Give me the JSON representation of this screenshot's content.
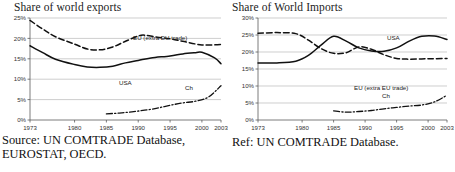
{
  "figure": {
    "panels": [
      {
        "id": "exports",
        "title": "Share of world exports",
        "caption": "Source: UN COMTRADE Database, EUROSTAT, OECD.",
        "labels": {
          "eu": "EU (extra EU trade)",
          "usa": "USA",
          "ch": "Ch"
        }
      },
      {
        "id": "imports",
        "title": "Share of World Imports",
        "caption": "Ref: UN COMTRADE Database.",
        "labels": {
          "eu": "EU (extra EU trade)",
          "usa": "USA",
          "ch": "Ch"
        }
      }
    ]
  },
  "chart_data": [
    {
      "type": "line",
      "title": "Share of world exports",
      "xlabel": "",
      "ylabel": "",
      "xlim": [
        1973,
        2003
      ],
      "ylim": [
        0,
        25
      ],
      "grid": true,
      "legend_position": "inline-annotations",
      "xticks": [
        1973,
        1980,
        1985,
        1990,
        1995,
        2000,
        2003
      ],
      "xticklabels": [
        "1973",
        "1980",
        "1985",
        "1990",
        "1995",
        "2000",
        "2003"
      ],
      "yticks": [
        0,
        5,
        10,
        15,
        20,
        25
      ],
      "yticklabels": [
        "0%",
        "5%",
        "10%",
        "15%",
        "20%",
        "25%"
      ],
      "series": [
        {
          "name": "EU (extra EU trade)",
          "style": "dashed",
          "x": [
            1973,
            1975,
            1977,
            1980,
            1982,
            1984,
            1986,
            1988,
            1990,
            1991,
            1993,
            1995,
            1997,
            2000,
            2003
          ],
          "values": [
            24.4,
            22.3,
            20.4,
            18.6,
            17.4,
            17.2,
            17.9,
            19.3,
            20.6,
            20.8,
            20.3,
            19.9,
            19.3,
            18.4,
            18.5
          ]
        },
        {
          "name": "USA",
          "style": "solid",
          "x": [
            1973,
            1975,
            1977,
            1980,
            1982,
            1984,
            1986,
            1988,
            1990,
            1992,
            1995,
            1997,
            1999,
            2000,
            2002,
            2003
          ],
          "values": [
            18.2,
            16.5,
            14.9,
            13.6,
            13.0,
            12.9,
            13.2,
            14.0,
            14.6,
            15.2,
            15.7,
            16.2,
            16.5,
            16.6,
            15.2,
            13.8
          ]
        },
        {
          "name": "Ch",
          "style": "dash-dot",
          "x": [
            1985,
            1987,
            1989,
            1991,
            1993,
            1995,
            1997,
            1999,
            2001,
            2003
          ],
          "values": [
            1.5,
            1.7,
            2.0,
            2.4,
            2.9,
            3.6,
            4.2,
            4.6,
            5.6,
            8.4
          ]
        }
      ]
    },
    {
      "type": "line",
      "title": "Share of World Imports",
      "xlabel": "",
      "ylabel": "",
      "xlim": [
        1973,
        2003
      ],
      "ylim": [
        0,
        30
      ],
      "grid": true,
      "legend_position": "inline-annotations",
      "xticks": [
        1973,
        1980,
        1985,
        1990,
        1995,
        2000,
        2003
      ],
      "xticklabels": [
        "1973",
        "1980",
        "1985",
        "1990",
        "1995",
        "2000",
        "2003"
      ],
      "yticks": [
        0,
        5,
        10,
        15,
        20,
        25,
        30
      ],
      "yticklabels": [
        "0%",
        "5%",
        "10%",
        "15%",
        "20%",
        "25%",
        "30%"
      ],
      "series": [
        {
          "name": "EU (extra EU trade)",
          "style": "dashed",
          "x": [
            1973,
            1976,
            1979,
            1981,
            1983,
            1985,
            1987,
            1989,
            1991,
            1993,
            1995,
            1997,
            2000,
            2003
          ],
          "values": [
            25.5,
            25.7,
            25.4,
            23.5,
            21.0,
            19.6,
            19.8,
            21.5,
            20.8,
            19.2,
            18.1,
            17.9,
            18.0,
            18.1
          ]
        },
        {
          "name": "USA",
          "style": "solid",
          "x": [
            1973,
            1976,
            1979,
            1981,
            1983,
            1985,
            1987,
            1989,
            1991,
            1993,
            1995,
            1997,
            1999,
            2001,
            2003
          ],
          "values": [
            16.8,
            16.8,
            17.3,
            19.0,
            22.0,
            24.6,
            23.2,
            21.2,
            20.3,
            20.2,
            21.2,
            23.2,
            24.6,
            24.7,
            23.7
          ]
        },
        {
          "name": "Ch",
          "style": "dash-dot",
          "x": [
            1985,
            1987,
            1989,
            1991,
            1993,
            1995,
            1997,
            1999,
            2001,
            2003
          ],
          "values": [
            2.7,
            2.3,
            2.5,
            2.8,
            3.3,
            3.7,
            4.1,
            4.4,
            5.3,
            7.3
          ]
        }
      ]
    }
  ]
}
